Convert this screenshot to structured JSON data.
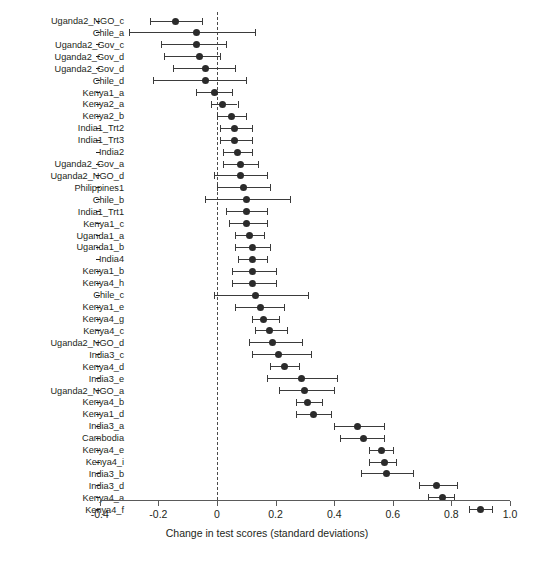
{
  "chart_data": {
    "type": "scatter",
    "subtype": "forest-plot",
    "title": "",
    "xlabel": "Change in test scores (standard deviations)",
    "ylabel": "",
    "xlim": [
      -0.4,
      1.0
    ],
    "xticks": [
      -0.4,
      -0.2,
      0,
      0.2,
      0.4,
      0.6,
      0.8,
      1.0
    ],
    "xticklabels": [
      "-0.4",
      "-0.2",
      "0",
      "0.2",
      "0.4",
      "0.6",
      "0.8",
      "1.0"
    ],
    "grid": false,
    "legend": "none",
    "reference_line": {
      "x": 0,
      "style": "dashed"
    },
    "marker": "filled-circle",
    "error_bars": "95% confidence interval",
    "categories": [
      "Uganda2_NGO_c",
      "Chile_a",
      "Uganda2_Gov_c",
      "Uganda2_Gov_d",
      "Uganda2_Gov_d",
      "Chile_d",
      "Kenya1_a",
      "Kenya2_a",
      "Kenya2_b",
      "India1_Trt2",
      "India1_Trt3",
      "India2",
      "Uganda2_Gov_a",
      "Uganda2_NGO_d",
      "Philippines1",
      "Chile_b",
      "India1_Trt1",
      "Kenya1_c",
      "Uganda1_a",
      "Uganda1_b",
      "India4",
      "Kenya1_b",
      "Kenya4_h",
      "Chile_c",
      "Kenya1_e",
      "Kenya4_g",
      "Kenya4_c",
      "Uganda2_NGO_d",
      "India3_c",
      "Kenya4_d",
      "India3_e",
      "Uganda2_NGO_a",
      "Kenya4_b",
      "Kenya1_d",
      "India3_a",
      "Cambodia",
      "Kenya4_e",
      "Kenya4_i",
      "India3_b",
      "India3_d",
      "Kenya4_a",
      "Kenya4_f"
    ],
    "points": [
      {
        "label": "Uganda2_NGO_c",
        "estimate": -0.14,
        "ci_low": -0.23,
        "ci_high": -0.05
      },
      {
        "label": "Chile_a",
        "estimate": -0.07,
        "ci_low": -0.3,
        "ci_high": 0.13
      },
      {
        "label": "Uganda2_Gov_c",
        "estimate": -0.07,
        "ci_low": -0.19,
        "ci_high": 0.03
      },
      {
        "label": "Uganda2_Gov_d",
        "estimate": -0.06,
        "ci_low": -0.18,
        "ci_high": 0.01
      },
      {
        "label": "Uganda2_Gov_d",
        "estimate": -0.04,
        "ci_low": -0.15,
        "ci_high": 0.06
      },
      {
        "label": "Chile_d",
        "estimate": -0.04,
        "ci_low": -0.22,
        "ci_high": 0.1
      },
      {
        "label": "Kenya1_a",
        "estimate": -0.01,
        "ci_low": -0.07,
        "ci_high": 0.05
      },
      {
        "label": "Kenya2_a",
        "estimate": 0.02,
        "ci_low": -0.02,
        "ci_high": 0.07
      },
      {
        "label": "Kenya2_b",
        "estimate": 0.05,
        "ci_low": 0.0,
        "ci_high": 0.1
      },
      {
        "label": "India1_Trt2",
        "estimate": 0.06,
        "ci_low": 0.01,
        "ci_high": 0.12
      },
      {
        "label": "India1_Trt3",
        "estimate": 0.06,
        "ci_low": 0.01,
        "ci_high": 0.12
      },
      {
        "label": "India2",
        "estimate": 0.07,
        "ci_low": 0.02,
        "ci_high": 0.12
      },
      {
        "label": "Uganda2_Gov_a",
        "estimate": 0.08,
        "ci_low": 0.02,
        "ci_high": 0.14
      },
      {
        "label": "Uganda2_NGO_d",
        "estimate": 0.08,
        "ci_low": -0.01,
        "ci_high": 0.17
      },
      {
        "label": "Philippines1",
        "estimate": 0.09,
        "ci_low": 0.0,
        "ci_high": 0.18
      },
      {
        "label": "Chile_b",
        "estimate": 0.1,
        "ci_low": -0.04,
        "ci_high": 0.25
      },
      {
        "label": "India1_Trt1",
        "estimate": 0.1,
        "ci_low": 0.03,
        "ci_high": 0.17
      },
      {
        "label": "Kenya1_c",
        "estimate": 0.1,
        "ci_low": 0.04,
        "ci_high": 0.17
      },
      {
        "label": "Uganda1_a",
        "estimate": 0.11,
        "ci_low": 0.06,
        "ci_high": 0.16
      },
      {
        "label": "Uganda1_b",
        "estimate": 0.12,
        "ci_low": 0.06,
        "ci_high": 0.18
      },
      {
        "label": "India4",
        "estimate": 0.12,
        "ci_low": 0.07,
        "ci_high": 0.17
      },
      {
        "label": "Kenya1_b",
        "estimate": 0.12,
        "ci_low": 0.05,
        "ci_high": 0.2
      },
      {
        "label": "Kenya4_h",
        "estimate": 0.12,
        "ci_low": 0.05,
        "ci_high": 0.2
      },
      {
        "label": "Chile_c",
        "estimate": 0.13,
        "ci_low": -0.01,
        "ci_high": 0.31
      },
      {
        "label": "Kenya1_e",
        "estimate": 0.15,
        "ci_low": 0.06,
        "ci_high": 0.23
      },
      {
        "label": "Kenya4_g",
        "estimate": 0.16,
        "ci_low": 0.12,
        "ci_high": 0.21
      },
      {
        "label": "Kenya4_c",
        "estimate": 0.18,
        "ci_low": 0.13,
        "ci_high": 0.24
      },
      {
        "label": "Uganda2_NGO_d",
        "estimate": 0.19,
        "ci_low": 0.11,
        "ci_high": 0.29
      },
      {
        "label": "India3_c",
        "estimate": 0.21,
        "ci_low": 0.12,
        "ci_high": 0.32
      },
      {
        "label": "Kenya4_d",
        "estimate": 0.23,
        "ci_low": 0.18,
        "ci_high": 0.28
      },
      {
        "label": "India3_e",
        "estimate": 0.29,
        "ci_low": 0.17,
        "ci_high": 0.41
      },
      {
        "label": "Uganda2_NGO_a",
        "estimate": 0.3,
        "ci_low": 0.21,
        "ci_high": 0.4
      },
      {
        "label": "Kenya4_b",
        "estimate": 0.31,
        "ci_low": 0.27,
        "ci_high": 0.36
      },
      {
        "label": "Kenya1_d",
        "estimate": 0.33,
        "ci_low": 0.27,
        "ci_high": 0.39
      },
      {
        "label": "India3_a",
        "estimate": 0.48,
        "ci_low": 0.4,
        "ci_high": 0.57
      },
      {
        "label": "Cambodia",
        "estimate": 0.5,
        "ci_low": 0.42,
        "ci_high": 0.57
      },
      {
        "label": "Kenya4_e",
        "estimate": 0.56,
        "ci_low": 0.52,
        "ci_high": 0.6
      },
      {
        "label": "Kenya4_i",
        "estimate": 0.57,
        "ci_low": 0.52,
        "ci_high": 0.61
      },
      {
        "label": "India3_b",
        "estimate": 0.58,
        "ci_low": 0.49,
        "ci_high": 0.67
      },
      {
        "label": "India3_d",
        "estimate": 0.75,
        "ci_low": 0.69,
        "ci_high": 0.82
      },
      {
        "label": "Kenya4_a",
        "estimate": 0.77,
        "ci_low": 0.72,
        "ci_high": 0.81
      },
      {
        "label": "Kenya4_f",
        "estimate": 0.9,
        "ci_low": 0.86,
        "ci_high": 0.94
      }
    ]
  },
  "colors": {
    "marker": "#2b2b2b",
    "error_bar": "#3b3b3b",
    "axis": "#5a5a5a",
    "reference_line": "#4a4a4a",
    "text": "#231f20",
    "background": "#ffffff"
  }
}
